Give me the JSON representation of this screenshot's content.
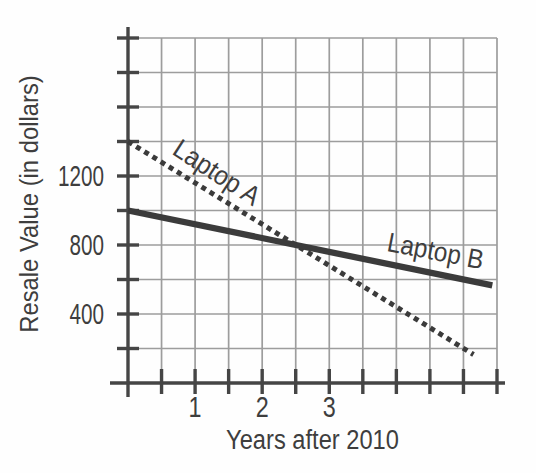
{
  "chart_data": {
    "type": "line",
    "title": "",
    "xlabel": "Years after 2010",
    "ylabel": "Resale Value (in dollars)",
    "xlim": [
      0,
      5.5
    ],
    "ylim": [
      0,
      2000
    ],
    "grid": true,
    "x_grid_step": 0.5,
    "y_grid_step": 200,
    "x_tick_step": 0.5,
    "y_tick_step": 200,
    "x_tick_labels": [
      {
        "value": 1,
        "label": "1"
      },
      {
        "value": 2,
        "label": "2"
      },
      {
        "value": 3,
        "label": "3"
      }
    ],
    "y_tick_labels": [
      {
        "value": 400,
        "label": "400"
      },
      {
        "value": 800,
        "label": "800"
      },
      {
        "value": 1200,
        "label": "1200"
      }
    ],
    "legend_position": "inline-labels",
    "series": [
      {
        "name": "Laptop A",
        "line_style": "dashed",
        "points": [
          [
            0,
            1400
          ],
          [
            5.15,
            165
          ]
        ],
        "value_at_year_0": 1400,
        "slope_dollars_per_year": -240,
        "label": {
          "text": "Laptop A",
          "x": 1.25,
          "y": 1177,
          "angle_deg": 33
        }
      },
      {
        "name": "Laptop B",
        "line_style": "solid",
        "points": [
          [
            0,
            1000
          ],
          [
            5.43,
            566
          ]
        ],
        "value_at_year_0": 1000,
        "slope_dollars_per_year": -80,
        "label": {
          "text": "Laptop B",
          "x": 4.56,
          "y": 713,
          "angle_deg": 11
        }
      }
    ],
    "intersection": {
      "x": 2.5,
      "y": 800
    },
    "colors": {
      "background": "#fefefe",
      "grid": "#9d9d9d",
      "axis": "#454545",
      "series_line": "#3b3b3b",
      "text": "#3e3e3e"
    },
    "layout": {
      "width": 536,
      "height": 473,
      "plot": {
        "left": 128,
        "top": 38,
        "right": 497,
        "bottom": 383
      },
      "y_axis_overhang_top": 11,
      "y_axis_overhang_bottom": 14,
      "x_axis_overhang_left": 18,
      "x_axis_overhang_right": 8,
      "tick_half_length": 11
    }
  }
}
